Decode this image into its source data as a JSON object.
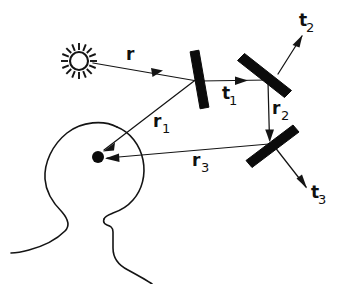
{
  "figure": {
    "kind": "optics-ray-diagram",
    "background_color": "#ffffff",
    "ink_color": "#141414",
    "mirror_color": "#0b0b0b",
    "title": "",
    "caption": ""
  },
  "labels": {
    "r": {
      "base": "r",
      "sub": "",
      "x": 126,
      "y": 60
    },
    "r1": {
      "base": "r",
      "sub": "1",
      "x": 153,
      "y": 127
    },
    "r2": {
      "base": "r",
      "sub": "2",
      "x": 272,
      "y": 114
    },
    "r3": {
      "base": "r",
      "sub": "3",
      "x": 192,
      "y": 166
    },
    "t1": {
      "base": "t",
      "sub": "1",
      "x": 222,
      "y": 99
    },
    "t2": {
      "base": "t",
      "sub": "2",
      "x": 299,
      "y": 26
    },
    "t3": {
      "base": "t",
      "sub": "3",
      "x": 311,
      "y": 198
    }
  },
  "objects": {
    "sun": {
      "name": "sun-source",
      "cx": 79,
      "cy": 61,
      "disc_radius": 9,
      "ray_count": 16,
      "ray_inner": 11,
      "ray_outer": 18
    },
    "eye": {
      "name": "observer-eye",
      "cx": 98,
      "cy": 157,
      "radius": 6
    },
    "head": {
      "name": "observer-head-profile"
    },
    "mirrors": [
      {
        "name": "mirror-1",
        "x1": 194,
        "y1": 51,
        "x2": 204,
        "y2": 108,
        "thickness": 9
      },
      {
        "name": "mirror-2",
        "x1": 241,
        "y1": 57,
        "x2": 288,
        "y2": 94,
        "thickness": 9
      },
      {
        "name": "mirror-3",
        "x1": 296,
        "y1": 129,
        "x2": 249,
        "y2": 164,
        "thickness": 9
      }
    ]
  },
  "rays": [
    {
      "name": "ray-r",
      "label": "r",
      "from": "sun",
      "to": "mirror-1",
      "x1": 93,
      "y1": 63,
      "x2": 199,
      "y2": 81
    },
    {
      "name": "ray-r1",
      "label": "r1",
      "from": "mirror-1",
      "to": "eye",
      "x1": 197,
      "y1": 78,
      "x2": 104,
      "y2": 150
    },
    {
      "name": "ray-t1",
      "label": "t1",
      "from": "mirror-1",
      "to": "mirror-2",
      "x1": 202,
      "y1": 81,
      "x2": 266,
      "y2": 80
    },
    {
      "name": "ray-t2",
      "label": "t2",
      "from": "mirror-2",
      "to": "outside",
      "x1": 278,
      "y1": 74,
      "x2": 300,
      "y2": 38
    },
    {
      "name": "ray-r2",
      "label": "r2",
      "from": "mirror-2",
      "to": "mirror-3",
      "x1": 268,
      "y1": 83,
      "x2": 270,
      "y2": 139
    },
    {
      "name": "ray-r3",
      "label": "r3",
      "from": "mirror-3",
      "to": "eye",
      "x1": 268,
      "y1": 144,
      "x2": 106,
      "y2": 158
    },
    {
      "name": "ray-t3",
      "label": "t3",
      "from": "mirror-3",
      "to": "outside",
      "x1": 275,
      "y1": 147,
      "x2": 305,
      "y2": 186
    }
  ]
}
